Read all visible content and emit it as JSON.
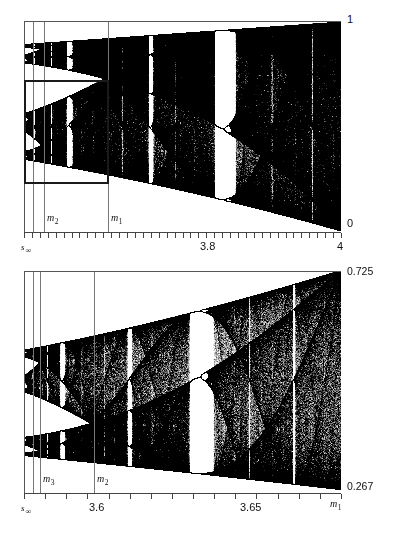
{
  "figure": {
    "background": "#ffffff",
    "point_color": "#000000",
    "frame_color": "#555555",
    "zoom_box_color": "#1a1a1a"
  },
  "chart_data": [
    {
      "type": "scatter",
      "name": "top-panel",
      "title": "",
      "xlabel": "",
      "ylabel": "",
      "xlim": [
        3.5699456,
        4.0
      ],
      "ylim": [
        0.0,
        1.0
      ],
      "grid": false,
      "legend": null,
      "map": "x_{n+1} = r x_n (1 - x_n)",
      "x_tick_labels": [
        "s ∞",
        "3.8",
        "4"
      ],
      "x_tick_label_values": [
        3.5699456,
        3.8,
        4.0
      ],
      "y_tick_labels": [
        "1",
        "0"
      ],
      "y_tick_label_values": [
        1.0,
        0.0
      ],
      "minor_tick_count": 40,
      "annotation_lines": [
        {
          "label": "m",
          "sub": "2",
          "value": 3.5925
        },
        {
          "label": "m",
          "sub": "1",
          "value": 3.6786
        }
      ],
      "zoom_box": {
        "x0": 3.5699456,
        "x1": 3.6786,
        "y0": 0.267,
        "y1": 0.725
      }
    },
    {
      "type": "scatter",
      "name": "bottom-panel",
      "title": "",
      "xlabel": "",
      "ylabel": "",
      "xlim": [
        3.5699456,
        3.6786
      ],
      "ylim": [
        0.267,
        0.725
      ],
      "grid": false,
      "legend": null,
      "map": "x_{n+1} = r x_n (1 - x_n)",
      "x_tick_labels": [
        "s ∞",
        "3.6",
        "3.65",
        "m 1"
      ],
      "x_tick_label_values": [
        3.5699456,
        3.6,
        3.65,
        3.6786
      ],
      "y_tick_labels": [
        "0.725",
        "0.267"
      ],
      "y_tick_label_values": [
        0.725,
        0.267
      ],
      "minor_tick_count": 15,
      "annotation_lines": [
        {
          "label": "m",
          "sub": "3",
          "value": 3.5748
        },
        {
          "label": "m",
          "sub": "2",
          "value": 3.5925
        }
      ],
      "zoom_box": null
    }
  ],
  "top_panel": {
    "y_top_label": "1",
    "y_bottom_label": "0",
    "x_left_label": "s",
    "x_left_sub": "∞",
    "x_mid_label": "3.8",
    "x_right_label": "4",
    "m2_label": "m",
    "m2_sub": "2",
    "m1_label": "m",
    "m1_sub": "1"
  },
  "bottom_panel": {
    "y_top_label": "0.725",
    "y_bottom_label": "0.267",
    "x_left_label": "s",
    "x_left_sub": "∞",
    "x_mid_label": "3.6",
    "x_mid2_label": "3.65",
    "x_right_label": "m",
    "x_right_sub": "1",
    "m3_label": "m",
    "m3_sub": "3",
    "m2_label": "m",
    "m2_sub": "2"
  }
}
